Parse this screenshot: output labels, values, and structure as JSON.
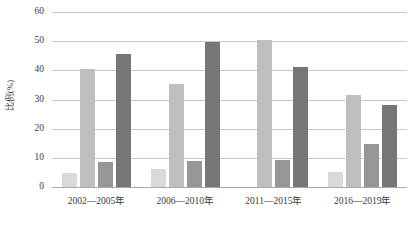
{
  "chart_data": {
    "type": "bar",
    "title": "",
    "subtitle": "",
    "xlabel": "",
    "ylabel": "比例(%)",
    "ylim": [
      0,
      60
    ],
    "ytick_labels": [
      "60",
      "50",
      "40",
      "30",
      "20",
      "10",
      "0"
    ],
    "ytick_values": [
      60,
      50,
      40,
      30,
      20,
      10,
      0
    ],
    "grid": "horizontal",
    "legend": "none",
    "categories": [
      "2002—2005年",
      "2006—2010年",
      "2011—2015年",
      "2016—2019年"
    ],
    "series": [
      {
        "name": "系列1",
        "color": "#d9d9d9",
        "values": [
          4.7,
          6.3,
          0,
          5.1
        ]
      },
      {
        "name": "系列2",
        "color": "#bfbfbf",
        "values": [
          40.6,
          35.3,
          50.4,
          31.4
        ]
      },
      {
        "name": "系列3",
        "color": "#969696",
        "values": [
          8.6,
          9.0,
          9.3,
          14.8
        ]
      },
      {
        "name": "系列4",
        "color": "#767676",
        "values": [
          45.7,
          49.8,
          41.2,
          28.2
        ]
      }
    ]
  },
  "colors": {
    "gridline": "#c8c8c8",
    "baseline": "#a8a8a8",
    "text": "#3a3a3a",
    "background": "#ffffff"
  }
}
